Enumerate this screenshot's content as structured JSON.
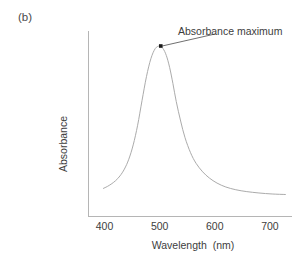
{
  "figure": {
    "panel_label": "(b)",
    "background_color": "#ffffff",
    "curve_color": "#ababab",
    "axis_color": "#b5b5b5",
    "text_color": "#3d3d3d",
    "marker_color": "#1a1a1a"
  },
  "annotation": {
    "label": "Absorbance maximum",
    "marker_name": "absorbance-maximum-marker"
  },
  "chart_data": {
    "type": "line",
    "title": "",
    "subtitle": "",
    "xlabel": "Wavelength  (nm)",
    "ylabel": "Absorbance",
    "xlim": [
      370,
      740
    ],
    "ylim": [
      0,
      1.05
    ],
    "xticks": [
      400,
      500,
      600,
      700
    ],
    "xtick_labels": [
      "400",
      "500",
      "600",
      "700"
    ],
    "yticks": [],
    "ytick_labels": [],
    "grid": false,
    "legend": false,
    "legend_position": "none",
    "annotations": [
      {
        "text": "Absorbance maximum",
        "point_x": 502,
        "point_y": 1.0,
        "leader_to_x": 600,
        "leader_to_y": 1.07
      }
    ],
    "series": [
      {
        "name": "Absorbance spectrum",
        "x": [
          398,
          405,
          412,
          420,
          428,
          436,
          444,
          452,
          460,
          468,
          476,
          484,
          492,
          500,
          506,
          512,
          518,
          524,
          530,
          538,
          546,
          556,
          566,
          578,
          590,
          604,
          620,
          638,
          658,
          680,
          704,
          728
        ],
        "y": [
          0.165,
          0.176,
          0.19,
          0.21,
          0.238,
          0.278,
          0.336,
          0.42,
          0.535,
          0.68,
          0.82,
          0.925,
          0.985,
          1.0,
          0.985,
          0.945,
          0.875,
          0.78,
          0.675,
          0.56,
          0.462,
          0.374,
          0.312,
          0.262,
          0.226,
          0.196,
          0.173,
          0.157,
          0.146,
          0.138,
          0.132,
          0.129
        ]
      }
    ]
  }
}
